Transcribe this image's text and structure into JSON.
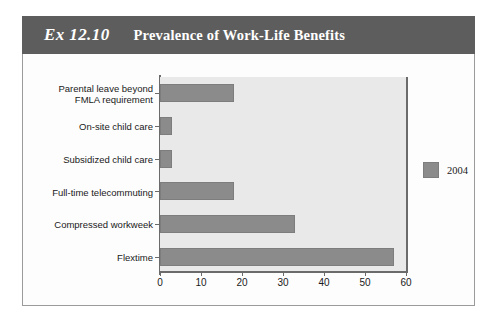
{
  "exhibit": {
    "number": "Ex 12.10",
    "title": "Prevalence of Work-Life Benefits"
  },
  "chart_data": {
    "type": "bar",
    "orientation": "horizontal",
    "title": "Prevalence of Work-Life Benefits",
    "xlabel": "",
    "ylabel": "",
    "xlim": [
      0,
      60
    ],
    "xticks": [
      0,
      10,
      20,
      30,
      40,
      50,
      60
    ],
    "xtick_labels": [
      "0",
      "10",
      "20",
      "30",
      "40",
      "50",
      "60"
    ],
    "grid": false,
    "legend_position": "right",
    "bar_color": "#8b8b8b",
    "plot_background": "#e9e9e9",
    "categories": [
      "Parental leave beyond FMLA requirement",
      "On-site child care",
      "Subsidized child care",
      "Full-time telecommuting",
      "Compressed workweek",
      "Flextime"
    ],
    "category_label_lines": [
      [
        "Parental leave beyond",
        "FMLA requirement"
      ],
      [
        "On-site child care"
      ],
      [
        "Subsidized child care"
      ],
      [
        "Full-time telecommuting"
      ],
      [
        "Compressed workweek"
      ],
      [
        "Flextime"
      ]
    ],
    "series": [
      {
        "name": "2004",
        "values": [
          18,
          3,
          3,
          18,
          33,
          57
        ]
      }
    ]
  },
  "legend": {
    "entries": [
      {
        "label": "2004",
        "color": "#8b8b8b"
      }
    ]
  }
}
